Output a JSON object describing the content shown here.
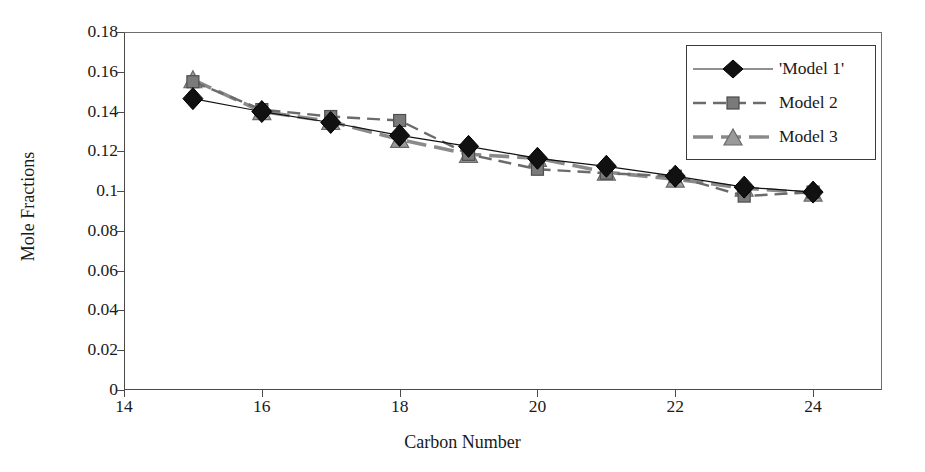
{
  "chart_data": {
    "type": "line",
    "title": "",
    "xlabel": "Carbon Number",
    "ylabel": "Mole Fractions",
    "x": [
      15,
      16,
      17,
      18,
      19,
      20,
      21,
      22,
      23,
      24
    ],
    "xlim": [
      14,
      25
    ],
    "ylim": [
      0,
      0.18
    ],
    "xticks": [
      14,
      16,
      18,
      20,
      22,
      24
    ],
    "xtick_labels": [
      "14",
      "16",
      "18",
      "20",
      "22",
      "24"
    ],
    "yticks": [
      0,
      0.02,
      0.04,
      0.06,
      0.08,
      0.1,
      0.12,
      0.14,
      0.16,
      0.18
    ],
    "ytick_labels": [
      "0",
      "0.02",
      "0.04",
      "0.06",
      "0.08",
      "0.1",
      "0.12",
      "0.14",
      "0.16",
      "0.18"
    ],
    "grid": false,
    "legend_position": "top-right",
    "series": [
      {
        "name": "'Model 1'",
        "marker": "diamond",
        "line": "solid",
        "color": "#111111",
        "values": [
          0.1465,
          0.14,
          0.1345,
          0.128,
          0.1225,
          0.1165,
          0.1125,
          0.1075,
          0.102,
          0.0995
        ]
      },
      {
        "name": "Model 2",
        "marker": "square",
        "line": "dashed",
        "color": "#6b6b6b",
        "values": [
          0.155,
          0.141,
          0.1375,
          0.1355,
          0.1185,
          0.111,
          0.109,
          0.1075,
          0.0975,
          0.0995
        ]
      },
      {
        "name": "Model 3",
        "marker": "triangle",
        "line": "dashed-thick",
        "color": "#8a8a8a",
        "values": [
          0.156,
          0.14,
          0.135,
          0.126,
          0.1185,
          0.1165,
          0.1095,
          0.106,
          0.1015,
          0.099
        ]
      }
    ]
  },
  "axis": {
    "x_title": "Carbon Number",
    "y_title": "Mole Fractions"
  },
  "legend": {
    "items": [
      {
        "label": "'Model 1'"
      },
      {
        "label": "Model 2"
      },
      {
        "label": "Model 3"
      }
    ]
  }
}
